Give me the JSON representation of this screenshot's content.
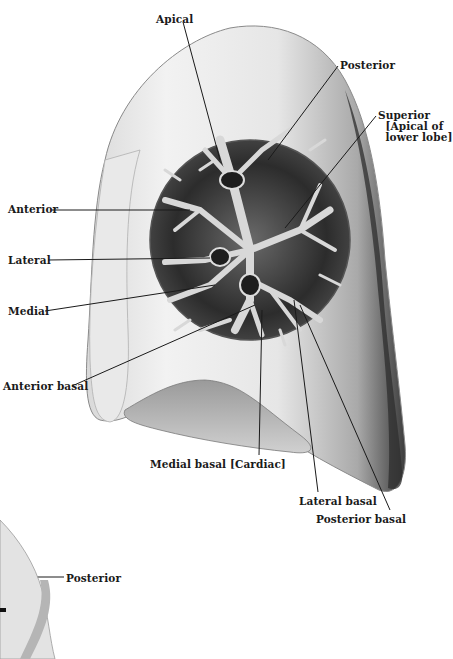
{
  "figure": {
    "colors": {
      "background": "#ffffff",
      "ink": "#1a1a1a",
      "lung_light": "#e8e8e8",
      "lung_mid": "#b8b8b8",
      "lung_dark": "#3a3a3a",
      "bronchi": "#d6d6d6"
    }
  },
  "labels": [
    {
      "id": "apical",
      "text": "Apical",
      "x": 156,
      "y": 14
    },
    {
      "id": "posterior-top",
      "text": "Posterior",
      "x": 340,
      "y": 60
    },
    {
      "id": "superior",
      "text": "Superior\n  [Apical of\n  lower lobe]",
      "x": 378,
      "y": 110
    },
    {
      "id": "anterior",
      "text": "Anterior",
      "x": 8,
      "y": 204
    },
    {
      "id": "lateral",
      "text": "Lateral",
      "x": 8,
      "y": 255
    },
    {
      "id": "medial",
      "text": "Medial",
      "x": 8,
      "y": 306
    },
    {
      "id": "anterior-basal",
      "text": "Anterior basal",
      "x": 3,
      "y": 381
    },
    {
      "id": "medial-basal",
      "text": "Medial basal [Cardiac]",
      "x": 150,
      "y": 459
    },
    {
      "id": "lateral-basal",
      "text": "Lateral basal",
      "x": 299,
      "y": 496
    },
    {
      "id": "posterior-basal",
      "text": "Posterior basal",
      "x": 316,
      "y": 514
    },
    {
      "id": "posterior-bottom",
      "text": "Posterior",
      "x": 66,
      "y": 573
    }
  ]
}
